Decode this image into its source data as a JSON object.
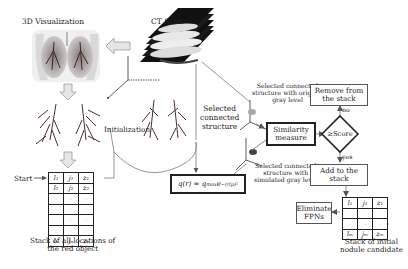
{
  "diagram": {
    "titles": {
      "visualization": "3D Visualization",
      "ct_scan": "CT Scan"
    },
    "labels": {
      "initialization": "Initialization",
      "start": "Start",
      "selected_structure": "Selected\nconnected\nstructure",
      "original_gray": "Selected connected\nstructure with original\ngray level",
      "simulated_gray": "Selected connected\nstructure with\nsimulated gray level",
      "stack_all": "Stack of all locations of\nthe red object",
      "stack_initial": "Stack of initial\nnodule candidate",
      "no": "no",
      "yes": "yes"
    },
    "boxes": {
      "similarity": "Similarity\nmeasure",
      "remove": "Remove from\nthe stack",
      "add": "Add to the\nstack",
      "eliminate": "Eliminate\nFPNs",
      "decision": "≥Score",
      "formula_q": "q(r) = q",
      "formula_sub": "max",
      "formula_e": " e",
      "formula_sup": "−(r/ρ)²"
    },
    "stack_all_locations": {
      "rows": [
        [
          "l₁",
          "j₁",
          "z₁"
        ],
        [
          "l₂",
          "j₂",
          "z₂"
        ],
        [
          "·",
          "·",
          "·"
        ],
        [
          "·",
          "·",
          "·"
        ],
        [
          "·",
          "·",
          "·"
        ],
        [
          "·",
          "·",
          "·"
        ],
        [
          "lₙ",
          "jₙ",
          "zₙ"
        ]
      ]
    },
    "stack_initial_candidates": {
      "rows": [
        [
          "l₁",
          "j₁",
          "z₁"
        ],
        [
          "·",
          "·",
          "·"
        ],
        [
          "·",
          "·",
          "·"
        ],
        [
          "lₘ",
          "jₘ",
          "zₘ"
        ]
      ]
    },
    "colors": {
      "line": "#222222",
      "arrow_fill": "#e6e6e6",
      "connector": "#888888",
      "lung_dark": "#5a3a3a",
      "lung_light": "#dcdcdc"
    }
  }
}
